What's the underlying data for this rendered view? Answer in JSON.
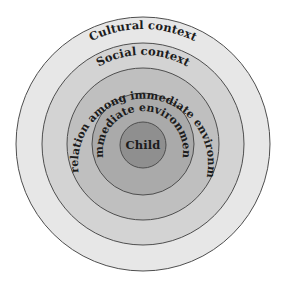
{
  "diagram": {
    "type": "concentric-circles",
    "center": {
      "x": 143,
      "y": 144
    },
    "rings": [
      {
        "id": "cultural",
        "label": "Cultural context",
        "radius": 127,
        "fill": "#e7e7e7"
      },
      {
        "id": "social",
        "label": "Social context",
        "radius": 101,
        "fill": "#d3d3d3"
      },
      {
        "id": "interrelation",
        "label": "Interrelation among immediate environments",
        "radius": 76,
        "fill": "#bfbfbf"
      },
      {
        "id": "immediate",
        "label": "Immediate environment",
        "radius": 51,
        "fill": "#aaaaaa"
      },
      {
        "id": "child",
        "label": "Child",
        "radius": 23,
        "fill": "#8f8f8f"
      }
    ],
    "stroke_color": "#4e4e4e"
  }
}
